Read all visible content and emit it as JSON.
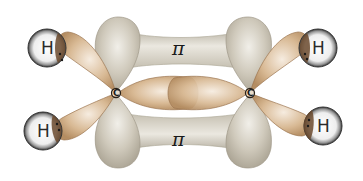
{
  "diagram": {
    "pi_bonds": [
      {
        "label": "π",
        "position": "top"
      },
      {
        "label": "π",
        "position": "bottom"
      }
    ],
    "carbon_atoms": [
      {
        "label": "C",
        "position": "left"
      },
      {
        "label": "C",
        "position": "right"
      }
    ],
    "hydrogen_atoms": [
      {
        "label": "H",
        "position": "top-left"
      },
      {
        "label": "H",
        "position": "bottom-left"
      },
      {
        "label": "H",
        "position": "top-right"
      },
      {
        "label": "H",
        "position": "bottom-right"
      }
    ],
    "colors": {
      "pi_orbital": "#c9c3b4",
      "pi_orbital_highlight": "#ece9e1",
      "sigma_orbital": "#d3b38f",
      "sigma_orbital_highlight": "#f2e6d6",
      "sigma_outline": "#9c7650",
      "hydrogen_fill": "#f4f4f4",
      "hydrogen_rim": "#3a3a3a",
      "background": "#ffffff"
    }
  }
}
